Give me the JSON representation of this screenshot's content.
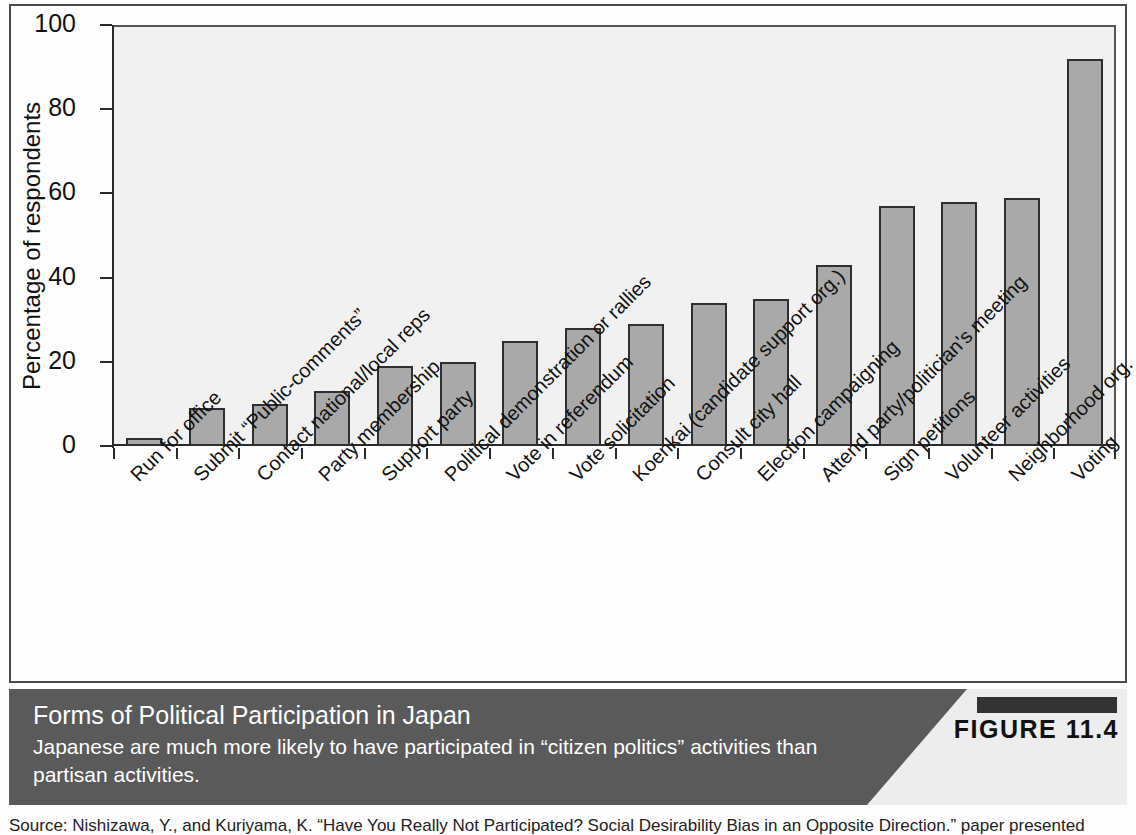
{
  "figure": {
    "badge_label": "FIGURE 11.4",
    "caption_title": "Forms of Political Participation in Japan",
    "caption_subtitle": "Japanese are much more likely to have participated in “citizen politics” activities than partisan activities.",
    "source": "Source: Nishizawa, Y., and Kuriyama, K. “Have You Really Not Participated? Social Desirability Bias in an Opposite Direction.” paper presented"
  },
  "colors": {
    "bar_fill": "#a9a9a9",
    "bar_stroke": "#2f2f2f",
    "plot_background": "#f1f1f1",
    "caption_dark": "#5a5a5a",
    "caption_light": "#ededed",
    "badge_bar": "#333333"
  },
  "chart_data": {
    "type": "bar",
    "title": "Forms of Political Participation in Japan",
    "xlabel": "",
    "ylabel": "Percentage of respondents",
    "ylim": [
      0,
      100
    ],
    "yticks": [
      0,
      20,
      40,
      60,
      80,
      100
    ],
    "grid": false,
    "legend": "none",
    "categories": [
      "Run for office",
      "Submit “Public-comments”",
      "Contact national/local reps",
      "Party membership",
      "Support party",
      "Political demonstration or rallies",
      "Vote in referendum",
      "Vote solicitation",
      "Koenkai (candidate support org.)",
      "Consult city hall",
      "Election campaigning",
      "Attend party/politician's meeting",
      "Sign petitions",
      "Volunteer activities",
      "Neighborhood org.",
      "Voting"
    ],
    "values": [
      2,
      9,
      10,
      13,
      19,
      20,
      25,
      28,
      29,
      34,
      35,
      43,
      57,
      58,
      59,
      92
    ]
  }
}
